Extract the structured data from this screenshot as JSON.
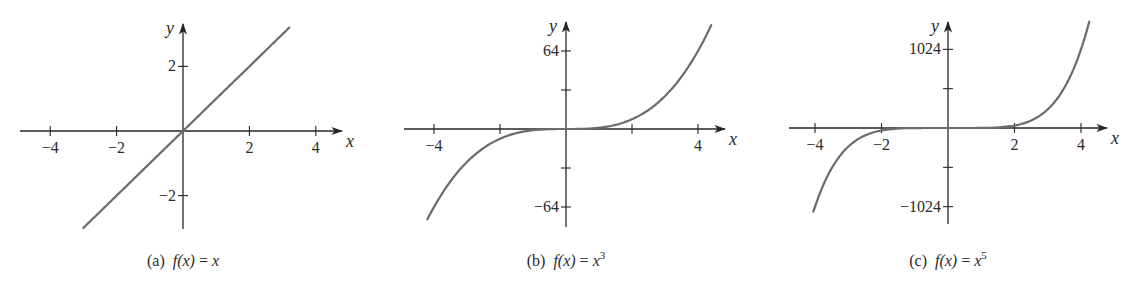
{
  "chart_data": [
    {
      "type": "line",
      "panel": "a",
      "title": "(a) f(x) = x",
      "caption": {
        "prefix": "(a)",
        "fn": "f(x)",
        "eq": "=",
        "rhs": "x",
        "exp": ""
      },
      "function": "x",
      "power": 1,
      "xlabel": "x",
      "ylabel": "y",
      "xticks": [
        -4,
        -2,
        2,
        4
      ],
      "xtick_labels": [
        "−4",
        "−2",
        "2",
        "4"
      ],
      "yticks": [
        2,
        -2
      ],
      "ytick_labels": [
        "2",
        "−2"
      ],
      "xlim": [
        -4.5,
        4.5
      ],
      "ylim": [
        -3.0,
        3.2
      ],
      "x_range_plotted": [
        -3.0,
        3.2
      ],
      "series": [
        {
          "name": "f(x) = x",
          "x": [
            -3,
            -2,
            -1,
            0,
            1,
            2,
            3,
            3.2
          ],
          "values": [
            -3,
            -2,
            -1,
            0,
            1,
            2,
            3,
            3.2
          ]
        }
      ],
      "grid": false,
      "color": "#6b6b6b"
    },
    {
      "type": "line",
      "panel": "b",
      "title": "(b) f(x) = x^3",
      "caption": {
        "prefix": "(b)",
        "fn": "f(x)",
        "eq": "=",
        "rhs": "x",
        "exp": "3"
      },
      "function": "x^3",
      "power": 3,
      "xlabel": "x",
      "ylabel": "y",
      "xticks": [
        -4,
        -2,
        2,
        4
      ],
      "xtick_labels": [
        "−4",
        "",
        "",
        "4"
      ],
      "yticks": [
        64,
        32,
        -32,
        -64
      ],
      "ytick_labels": [
        "64",
        "",
        "",
        "−64"
      ],
      "xlim": [
        -4.5,
        4.5
      ],
      "ylim": [
        -80,
        88
      ],
      "x_range_plotted": [
        -4.2,
        4.4
      ],
      "series": [
        {
          "name": "f(x) = x^3",
          "x": [
            -4.2,
            -4,
            -3,
            -2,
            -1,
            0,
            1,
            2,
            3,
            4,
            4.4
          ],
          "values": [
            -74.1,
            -64,
            -27,
            -8,
            -1,
            0,
            1,
            8,
            27,
            64,
            85.2
          ]
        }
      ],
      "grid": false,
      "color": "#6b6b6b"
    },
    {
      "type": "line",
      "panel": "c",
      "title": "(c) f(x) = x^5",
      "caption": {
        "prefix": "(c)",
        "fn": "f(x)",
        "eq": "=",
        "rhs": "x",
        "exp": "5"
      },
      "function": "x^5",
      "power": 5,
      "xlabel": "x",
      "ylabel": "y",
      "xticks": [
        -4,
        -2,
        2,
        4
      ],
      "xtick_labels": [
        "−4",
        "−2",
        "2",
        "4"
      ],
      "yticks": [
        1024,
        512,
        -512,
        -1024
      ],
      "ytick_labels": [
        "1024",
        "",
        "",
        "−1024"
      ],
      "xlim": [
        -4.5,
        4.5
      ],
      "ylim": [
        -1260,
        1440
      ],
      "x_range_plotted": [
        -4.05,
        4.25
      ],
      "series": [
        {
          "name": "f(x) = x^5",
          "x": [
            -4.05,
            -4,
            -3,
            -2,
            -1,
            0,
            1,
            2,
            3,
            4,
            4.25
          ],
          "values": [
            -1077,
            -1024,
            -243,
            -32,
            -1,
            0,
            1,
            32,
            243,
            1024,
            1386
          ]
        }
      ],
      "grid": false,
      "color": "#6b6b6b"
    }
  ],
  "layout": {
    "panels": [
      {
        "ox": 183,
        "oy": 131,
        "xunit": 33.2,
        "yunit": 32.3,
        "ytop": 24,
        "ybottom": 229,
        "xleft": 20,
        "xright": 342,
        "caption_x": 183
      },
      {
        "ox": 566,
        "oy": 129,
        "xunit": 33.0,
        "yunit": 1.219,
        "ytop": 22,
        "ybottom": 227,
        "xleft": 404,
        "xright": 725,
        "caption_x": 566
      },
      {
        "ox": 948,
        "oy": 128,
        "xunit": 33.25,
        "yunit": 0.0768,
        "ytop": 22,
        "ybottom": 224,
        "xleft": 789,
        "xright": 1107,
        "caption_x": 948
      }
    ]
  }
}
